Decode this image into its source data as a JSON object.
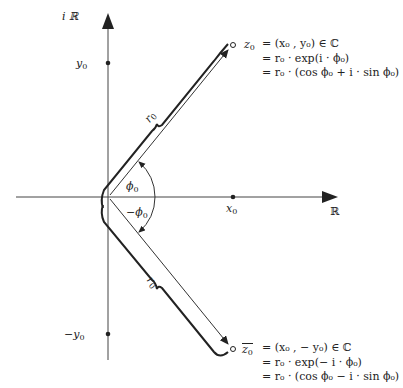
{
  "axes": {
    "real_label": "ℝ",
    "imag_label": "i ℝ",
    "x0_label": "x",
    "y0_label": "y",
    "neg_y0_label": "−y",
    "sub": "0"
  },
  "angles": {
    "phi": "ϕ",
    "neg_phi": "−ϕ",
    "sub": "0"
  },
  "radii": {
    "r_upper": "r",
    "r_lower": "r",
    "sub": "0"
  },
  "z0": {
    "name": "z",
    "line1": "=  (x₀ , y₀) ∈ ℂ",
    "line2": "=  r₀ · exp(i · ϕ₀)",
    "line3": "=  r₀ · (cos ϕ₀ + i · sin ϕ₀)"
  },
  "z0_conj": {
    "name": "z̄",
    "line1": "=  (x₀ , − y₀) ∈ ℂ",
    "line2": "=  r₀ · exp(− i · ϕ₀)",
    "line3": "=  r₀ · (cos ϕ₀ − i · sin ϕ₀)"
  },
  "colors": {
    "ink": "#222222",
    "axis": "#444444"
  }
}
